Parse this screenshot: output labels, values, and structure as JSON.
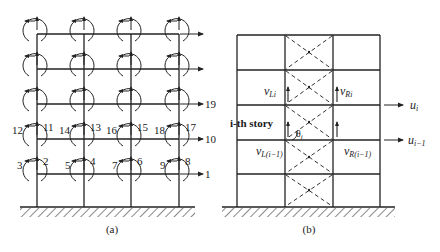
{
  "panel_a": {
    "caption": "(a)",
    "dof_labels": {
      "top_horizontal": "19",
      "mid_horizontal": "10",
      "bottom_horizontal": "1",
      "story2": [
        "12",
        "11",
        "14",
        "13",
        "16",
        "15",
        "18",
        "17"
      ],
      "story1": [
        "3",
        "2",
        "5",
        "4",
        "7",
        "6",
        "9",
        "8"
      ]
    }
  },
  "panel_b": {
    "caption": "(b)",
    "story_label": "i-th story",
    "angle_label": "θ",
    "angle_sub": "i",
    "v_left_upper": "v",
    "v_left_upper_sub": "Li",
    "v_right_upper": "v",
    "v_right_upper_sub": "Ri",
    "v_left_lower": "v",
    "v_left_lower_sub": "L(i−1)",
    "v_right_lower": "v",
    "v_right_lower_sub": "R(i−1)",
    "u_upper": "u",
    "u_upper_sub": "i",
    "u_lower": "u",
    "u_lower_sub": "i−1"
  },
  "colors": {
    "line": "#222222",
    "hatch": "#888888",
    "text": "#1a1a1a"
  }
}
